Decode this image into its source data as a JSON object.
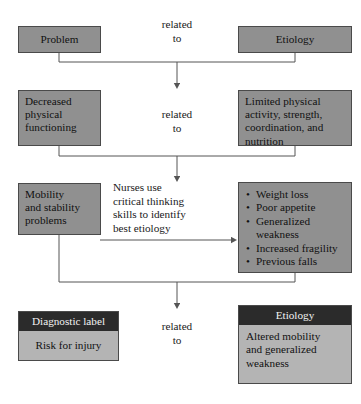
{
  "diagram": {
    "colors": {
      "box_fill": "#909090",
      "box_border": "#4a4a4a",
      "header_fill": "#2b2b2b",
      "header_text": "#f2f2f2",
      "body_fill": "#b4b4b4",
      "line": "#555555",
      "background": "#ffffff"
    },
    "rows": [
      {
        "id": "row-1",
        "left_box": "Problem",
        "connector_label": "related\nto",
        "connector_label_line1": "related",
        "connector_label_line2": "to",
        "right_box": "Etiology"
      },
      {
        "id": "row-2",
        "left_box": "Decreased\nphysical\nfunctioning",
        "left_box_lines": [
          "Decreased",
          "physical",
          "functioning"
        ],
        "connector_label_line1": "related",
        "connector_label_line2": "to",
        "right_box": "Limited physical activity, strength, coordination, and nutrition",
        "right_box_lines": [
          "Limited physical",
          "activity, strength,",
          "coordination, and",
          "nutrition"
        ]
      },
      {
        "id": "row-3",
        "left_box_lines": [
          "Mobility",
          "and stability",
          "problems"
        ],
        "center_text_lines": [
          "Nurses use",
          "critical thinking",
          "skills to identify",
          "best etiology"
        ],
        "right_bullets": [
          "Weight loss",
          "Poor appetite",
          "Generalized",
          "weakness",
          "Increased fragility",
          "Previous falls"
        ]
      },
      {
        "id": "row-4",
        "left_header": "Diagnostic label",
        "left_body": "Risk for injury",
        "connector_label_line1": "related",
        "connector_label_line2": "to",
        "right_header": "Etiology",
        "right_body_lines": [
          "Altered mobility",
          "and generalized",
          "weakness"
        ]
      }
    ]
  }
}
